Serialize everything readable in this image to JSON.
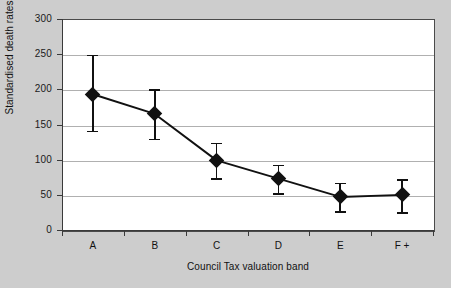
{
  "chart_data": {
    "type": "line",
    "title": "",
    "subtitle": "",
    "xlabel": "Council Tax valuation band",
    "ylabel": "Standardised death rates",
    "categories": [
      "A",
      "B",
      "C",
      "D",
      "E",
      "F +"
    ],
    "values": [
      193,
      165,
      99,
      73,
      47,
      50
    ],
    "error_low": [
      141,
      130,
      74,
      52,
      27,
      25
    ],
    "error_high": [
      249,
      200,
      124,
      93,
      67,
      72
    ],
    "series": [
      {
        "name": "Standardised death rates",
        "values": [
          193,
          165,
          99,
          73,
          47,
          50
        ]
      }
    ],
    "ylim": [
      0,
      300
    ],
    "yticks": [
      0,
      50,
      100,
      150,
      200,
      250,
      300
    ],
    "ytick_labels": [
      "0",
      "50",
      "100",
      "150",
      "200",
      "250",
      "300"
    ],
    "grid": "horizontal",
    "legend": "none",
    "marker": "diamond",
    "error_bars": true,
    "colors": {
      "series": "#111111",
      "grid": "#b0b0b0",
      "axis": "#3a3a3a",
      "plot_background": "#ffffff",
      "figure_background": "#cdcdcd"
    }
  }
}
